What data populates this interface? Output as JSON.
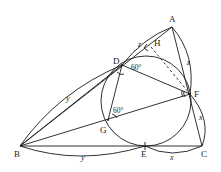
{
  "figure": {
    "type": "geometry-diagram",
    "points": {
      "A": "A",
      "B": "B",
      "C": "C",
      "D": "D",
      "E": "E",
      "F": "F",
      "G": "G",
      "H": "H"
    },
    "segment_labels": {
      "AD": "z",
      "AF": "z",
      "BD": "y",
      "BE": "y",
      "CF": "x",
      "CE": "x"
    },
    "angles": {
      "angle_FDA_side": "60°",
      "angle_DGF": "60°"
    },
    "annotations": {
      "right_angle_at_H": true,
      "dashed_segment": "HF"
    }
  }
}
